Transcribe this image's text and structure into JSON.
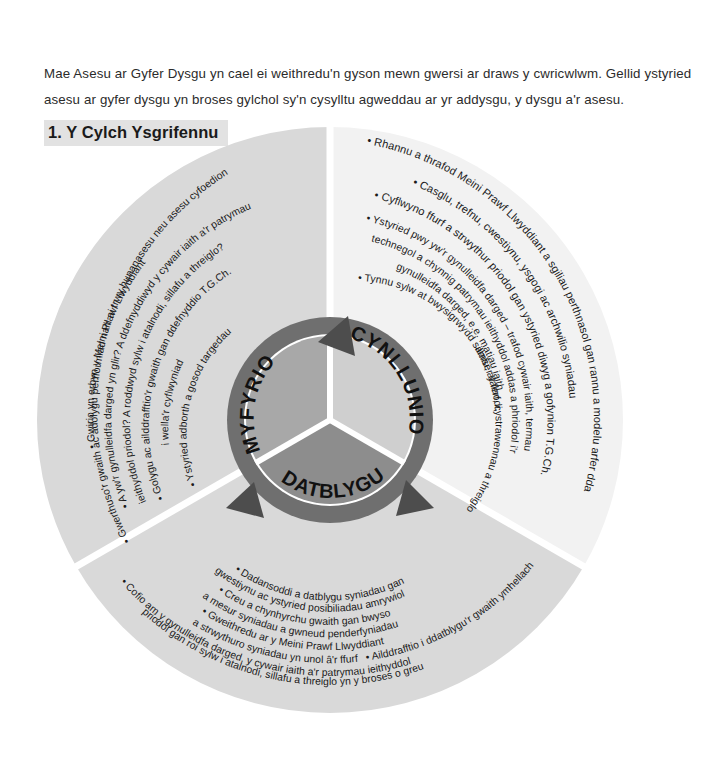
{
  "intro": {
    "paragraph": "Mae Asesu ar Gyfer Dysgu yn cael ei weithredu'n gyson mewn gwersi ar draws y cwricwlwm. Gellid ystyried asesu ar gyfer dysgu yn broses gylchol sy'n cysylltu agweddau ar yr addysgu, y dysgu a'r asesu."
  },
  "section": {
    "title": "1. Y Cylch Ysgrifennu"
  },
  "wheel": {
    "hub": {
      "segments": [
        {
          "id": "myfyrio",
          "label": "MYFYRIO",
          "color": "#a8a8a8"
        },
        {
          "id": "cynllunio",
          "label": "CYNLLUNIO",
          "color": "#cfcfcf"
        },
        {
          "id": "datblygu",
          "label": "DATBLYGU",
          "color": "#8d8d8d"
        }
      ],
      "ring_color": "#6f6f6f",
      "arrow_color": "#4d4d4d"
    },
    "sectors": [
      {
        "id": "cynllunio",
        "hub_label": "CYNLLUNIO",
        "fill": "#f2f2f2",
        "bullets": [
          "• Rhannu a thrafod Meini Prawf Llwyddiant a sgiliau perthnasol gan rannu a modelu arfer dda",
          "• Casglu, trefnu, cwestiynu, ysgogi ac archwilio syniadau",
          "• Cyflwyno ffurf a strwythur priodol gan ystyried diwyg a gofynion T.G.Ch.",
          "• Ystyried pwy yw'r gynulleidfa darged – trafod cywair iaith, termau technegol a chynnig patrymau ieithyddol addas a phriodol i'r gynulleidfa darged, e.e. matiau iaith",
          "• Tynnu sylw at bwysigrwydd sillafu, atalnodi, amser y ferf, cystrawennau a threiglo"
        ]
      },
      {
        "id": "myfyrio",
        "hub_label": "MYFYRIO",
        "fill": "#d9d9d9",
        "bullets": [
          "• Gwerthuso'r gwaith ac adolygu perfformiad naill ai trwy hunanasesu neu asesu cyfoedion",
          "• Gwirio yn erbyn y Meini Prawf Llwyddiant",
          "• A yw'r gynulleidfa darged yn glir? A ddefnyddiwyd y cywair iaith a'r patrymau ieithyddol priodol? A roddwyd sylw i atalnodi, sillafu a threiglo?",
          "• Golygu ac ailddrafftio'r gwaith gan ddefnyddio T.G.Ch. i wella'r cyflwyniad",
          "• Ystyried adborth a gosod targedau"
        ]
      },
      {
        "id": "datblygu",
        "hub_label": "DATBLYGU",
        "fill": "#d9d9d9",
        "bullets": [
          "• Dadansoddi a datblygu syniadau gan gwestiynu ac ystyried posibiliadau amrywiol",
          "• Creu a chynhyrchu gwaith gan bwyso a mesur syniadau a gwneud penderfyniadau",
          "• Gweithredu ar y Meini Prawf Llwyddiant a strwythuro syniadau yn unol â'r ffurf",
          "• Ailddrafftio i ddatblygu'r gwaith ymhellach",
          "• Cofio am y gynulleidfa darged, y cywair iaith a'r patrymau ieithyddol priodol gan roi sylw i atalnodi, sillafu a threiglo yn y broses o greu"
        ]
      }
    ]
  }
}
